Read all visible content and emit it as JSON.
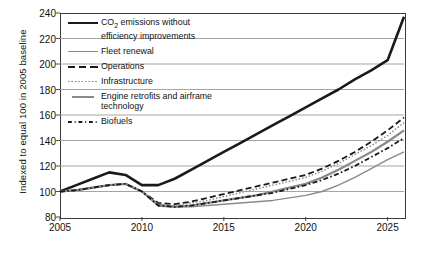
{
  "chart_data": {
    "type": "line",
    "title": "",
    "xlabel": "",
    "ylabel": "Indexed to equal 100 in 2005 baseline",
    "xlim": [
      2005,
      2026
    ],
    "ylim": [
      80,
      240
    ],
    "ytick_labels": [
      "240",
      "220",
      "200",
      "180",
      "160",
      "140",
      "120",
      "100",
      "80"
    ],
    "yticks": [
      240,
      220,
      200,
      180,
      160,
      140,
      120,
      100,
      80
    ],
    "xtick_labels": [
      "2005",
      "2010",
      "2015",
      "2020",
      "2025"
    ],
    "xticks": [
      2005,
      2010,
      2015,
      2020,
      2025
    ],
    "grid": "horizontal",
    "legend_position": "upper-left-inside",
    "x": [
      2005,
      2006,
      2007,
      2008,
      2009,
      2010,
      2011,
      2012,
      2013,
      2014,
      2015,
      2016,
      2017,
      2018,
      2019,
      2020,
      2021,
      2022,
      2023,
      2024,
      2025,
      2026
    ],
    "series": [
      {
        "name": "CO2 emissions without efficiency improvements",
        "style": "solid-thick-black",
        "color": "#1a1a1a",
        "values": [
          100,
          105,
          110,
          115,
          113,
          105,
          105,
          110,
          117,
          124,
          131,
          138,
          145,
          152,
          159,
          166,
          173,
          180,
          188,
          195,
          203,
          237
        ]
      },
      {
        "name": "Fleet renewal",
        "style": "solid-gray",
        "color": "#8a8a8a",
        "values": [
          100,
          101,
          103,
          105,
          106,
          100,
          90,
          88,
          88,
          89,
          90,
          91,
          92,
          93,
          95,
          97,
          100,
          105,
          111,
          118,
          125,
          131
        ]
      },
      {
        "name": "Operations",
        "style": "dashed-black",
        "color": "#1a1a1a",
        "values": [
          100,
          101,
          103,
          105,
          106,
          100,
          91,
          90,
          92,
          95,
          98,
          101,
          104,
          107,
          110,
          113,
          118,
          124,
          131,
          139,
          148,
          158
        ]
      },
      {
        "name": "Infrastructure",
        "style": "dotted-gray",
        "color": "#8a8a8a",
        "values": [
          100,
          101,
          103,
          105,
          106,
          100,
          90,
          89,
          91,
          93,
          96,
          99,
          102,
          105,
          108,
          111,
          116,
          122,
          129,
          136,
          144,
          154
        ]
      },
      {
        "name": "Engine retrofits and airframe technology",
        "style": "solid-thick-gray",
        "color": "#8a8a8a",
        "values": [
          100,
          101,
          103,
          105,
          106,
          100,
          89,
          88,
          89,
          91,
          93,
          95,
          97,
          100,
          103,
          106,
          111,
          117,
          124,
          131,
          139,
          148
        ]
      },
      {
        "name": "Biofuels",
        "style": "dashdot-black",
        "color": "#1a1a1a",
        "values": [
          100,
          101,
          103,
          105,
          106,
          100,
          89,
          88,
          89,
          91,
          93,
          95,
          97,
          99,
          102,
          105,
          109,
          114,
          120,
          127,
          134,
          142
        ]
      }
    ]
  },
  "legend": {
    "items": [
      {
        "key": "co2",
        "label_pre": "CO",
        "label_sub": "2",
        "label_post": " emissions without\nefficiency improvements"
      },
      {
        "key": "fleet",
        "label": "Fleet renewal"
      },
      {
        "key": "ops",
        "label": "Operations"
      },
      {
        "key": "infra",
        "label": "Infrastructure"
      },
      {
        "key": "engine",
        "label": "Engine retrofits and airframe\ntechnology"
      },
      {
        "key": "bio",
        "label": "Biofuels"
      }
    ]
  }
}
